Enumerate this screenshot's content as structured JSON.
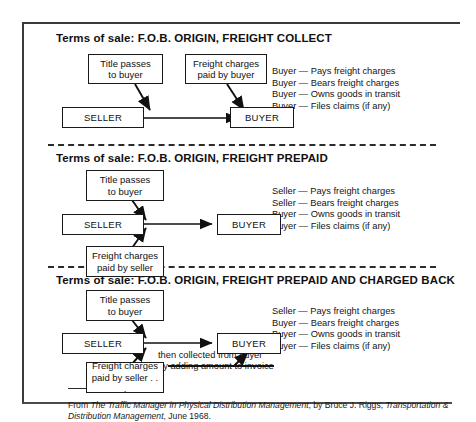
{
  "figure": {
    "sections": [
      {
        "id": "freight-collect",
        "heading": "Terms of sale: F.O.B. ORIGIN, FREIGHT COLLECT",
        "nodes": {
          "title_note": "Title passes\nto buyer",
          "freight_note": "Freight charges\npaid by buyer",
          "seller": "SELLER",
          "buyer": "BUYER"
        },
        "consequences": [
          "Buyer — Pays freight charges",
          "Buyer — Bears freight charges",
          "Buyer — Owns goods in transit",
          "Buyer — Files claims (if any)"
        ]
      },
      {
        "id": "freight-prepaid",
        "heading": "Terms of sale: F.O.B. ORIGIN, FREIGHT PREPAID",
        "nodes": {
          "title_note": "Title passes\nto buyer",
          "freight_note": "Freight charges\npaid by seller",
          "seller": "SELLER",
          "buyer": "BUYER"
        },
        "consequences": [
          "Seller — Pays freight charges",
          "Seller — Bears freight charges",
          "Buyer — Owns goods in transit",
          "Buyer — Files claims (if any)"
        ]
      },
      {
        "id": "freight-prepaid-charged-back",
        "heading": "Terms of sale: F.O.B. ORIGIN, FREIGHT PREPAID AND CHARGED BACK",
        "nodes": {
          "title_note": "Title passes\nto buyer",
          "freight_note": "Freight charges\npaid by seller . . .",
          "seller": "SELLER",
          "buyer": "BUYER"
        },
        "chargeback_caption": "then collected from buyer\nby adding amount to invoice",
        "consequences": [
          "Seller — Pays freight charges",
          "Buyer — Bears freight charges",
          "Buyer — Owns goods in transit",
          "Buyer — Files claims (if any)"
        ]
      }
    ],
    "source_note": {
      "prefix": "From ",
      "work_title": "The Traffic Manager in Physical Distribution Management",
      "author": ", by Bruce J. Riggs, ",
      "publication": "Transportation & Distribution Management",
      "date": ", June 1968."
    },
    "colors": {
      "ink": "#1a1a1a",
      "rule": "#3a3a3a",
      "paper": "#ffffff"
    }
  }
}
